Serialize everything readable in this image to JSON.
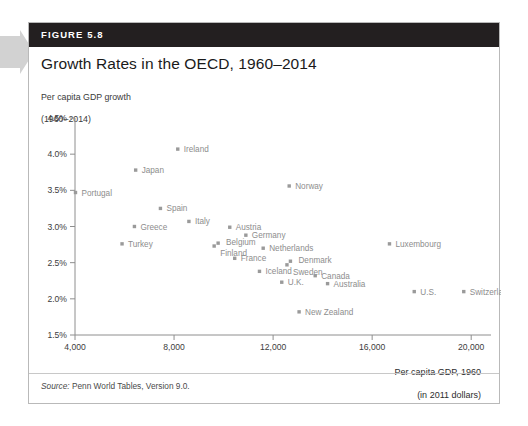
{
  "figure": {
    "number_label": "FIGURE 5.8",
    "title": "Growth Rates in the OECD, 1960–2014",
    "source": "Source: Penn World Tables, Version 9.0.",
    "source_prefix": "Source:",
    "source_rest": " Penn World Tables, Version 9.0."
  },
  "colors": {
    "header_bg": "#231f20",
    "header_text": "#ffffff",
    "marker": "#9a9a9a",
    "label": "#8d8d8d",
    "axis": "#8e8e8e",
    "card_border": "#b9b9b9",
    "arrow_tab": "#cfcfcf"
  },
  "chart_data": {
    "type": "scatter",
    "title": "Growth Rates in the OECD, 1960–2014",
    "ylabel": "Per capita GDP growth\n(1960–2014)",
    "ylabel_line1": "Per capita GDP growth",
    "ylabel_line2": "(1960–2014)",
    "xlabel": "Per capita GDP, 1960\n(in 2011 dollars)",
    "xlabel_line1": "Per capita GDP, 1960",
    "xlabel_line2": "(in 2011 dollars)",
    "xlim": [
      4000,
      20800
    ],
    "ylim": [
      1.5,
      4.5
    ],
    "xticks": [
      4000,
      8000,
      12000,
      16000,
      20000
    ],
    "xtick_labels": [
      "4,000",
      "8,000",
      "12,000",
      "16,000",
      "20,000"
    ],
    "yticks": [
      1.5,
      2.0,
      2.5,
      3.0,
      3.5,
      4.0,
      4.5
    ],
    "ytick_labels": [
      "1.5%",
      "2.0%",
      "2.5%",
      "3.0%",
      "3.5%",
      "4.0%",
      "4.5%"
    ],
    "grid": false,
    "legend": false,
    "points": [
      {
        "name": "Ireland",
        "x": 8150,
        "y": 4.07,
        "label_dx": 6,
        "label_dy": 3
      },
      {
        "name": "Japan",
        "x": 6450,
        "y": 3.78,
        "label_dx": 6,
        "label_dy": 3
      },
      {
        "name": "Norway",
        "x": 12650,
        "y": 3.56,
        "label_dx": 6,
        "label_dy": 3
      },
      {
        "name": "Portugal",
        "x": 4020,
        "y": 3.47,
        "label_dx": 6,
        "label_dy": 3
      },
      {
        "name": "Spain",
        "x": 7450,
        "y": 3.25,
        "label_dx": 6,
        "label_dy": 3
      },
      {
        "name": "Italy",
        "x": 8600,
        "y": 3.07,
        "label_dx": 6,
        "label_dy": 3
      },
      {
        "name": "Greece",
        "x": 6400,
        "y": 3.0,
        "label_dx": 6,
        "label_dy": 3
      },
      {
        "name": "Austria",
        "x": 10250,
        "y": 2.99,
        "label_dx": 6,
        "label_dy": 3
      },
      {
        "name": "Germany",
        "x": 10900,
        "y": 2.88,
        "label_dx": 6,
        "label_dy": 3
      },
      {
        "name": "Belgium",
        "x": 9780,
        "y": 2.77,
        "label_dx": 8,
        "label_dy": 2
      },
      {
        "name": "Finland",
        "x": 9620,
        "y": 2.73,
        "label_dx": 6,
        "label_dy": 10
      },
      {
        "name": "Turkey",
        "x": 5900,
        "y": 2.76,
        "label_dx": 6,
        "label_dy": 3
      },
      {
        "name": "Luxembourg",
        "x": 16700,
        "y": 2.76,
        "label_dx": 6,
        "label_dy": 3
      },
      {
        "name": "Netherlands",
        "x": 11600,
        "y": 2.7,
        "label_dx": 6,
        "label_dy": 3
      },
      {
        "name": "France",
        "x": 10450,
        "y": 2.56,
        "label_dx": 6,
        "label_dy": 3
      },
      {
        "name": "Denmark",
        "x": 12700,
        "y": 2.52,
        "label_dx": 8,
        "label_dy": 2
      },
      {
        "name": "Sweden",
        "x": 12560,
        "y": 2.47,
        "label_dx": 6,
        "label_dy": 10
      },
      {
        "name": "Iceland",
        "x": 11450,
        "y": 2.38,
        "label_dx": 6,
        "label_dy": 3
      },
      {
        "name": "Canada",
        "x": 13700,
        "y": 2.32,
        "label_dx": 6,
        "label_dy": 3
      },
      {
        "name": "U.K.",
        "x": 12350,
        "y": 2.23,
        "label_dx": 6,
        "label_dy": 3
      },
      {
        "name": "Australia",
        "x": 14200,
        "y": 2.21,
        "label_dx": 6,
        "label_dy": 3
      },
      {
        "name": "U.S.",
        "x": 17700,
        "y": 2.1,
        "label_dx": 6,
        "label_dy": 3
      },
      {
        "name": "Switzerland",
        "x": 19700,
        "y": 2.1,
        "label_dx": 6,
        "label_dy": 3
      },
      {
        "name": "New Zealand",
        "x": 13050,
        "y": 1.82,
        "label_dx": 6,
        "label_dy": 3
      }
    ]
  }
}
